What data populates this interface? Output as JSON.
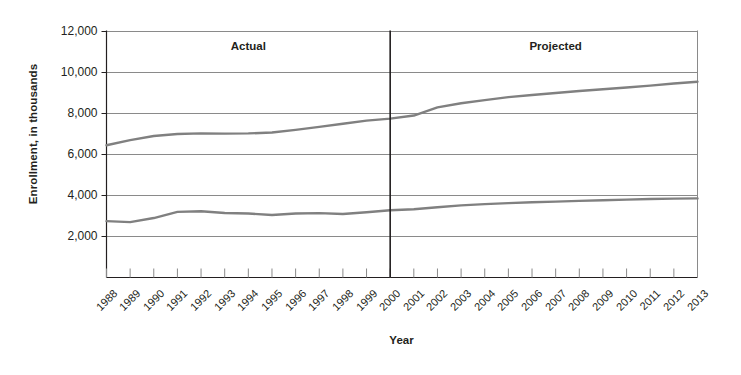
{
  "chart_data": {
    "type": "line",
    "title": "",
    "xlabel": "Year",
    "ylabel": "Enrollment, in thousands",
    "ylim": [
      0,
      12000
    ],
    "ytick_values": [
      2000,
      4000,
      6000,
      8000,
      10000,
      12000
    ],
    "ytick_labels": [
      "2,000",
      "4,000",
      "6,000",
      "8,000",
      "10,000",
      "12,000"
    ],
    "grid": "horizontal",
    "legend": "none",
    "categories": [
      "1988",
      "1989",
      "1990",
      "1991",
      "1992",
      "1993",
      "1994",
      "1995",
      "1996",
      "1997",
      "1998",
      "1999",
      "2000",
      "2001",
      "2002",
      "2003",
      "2004",
      "2005",
      "2006",
      "2007",
      "2008",
      "2009",
      "2010",
      "2011",
      "2012",
      "2013"
    ],
    "x": [
      1988,
      1989,
      1990,
      1991,
      1992,
      1993,
      1994,
      1995,
      1996,
      1997,
      1998,
      1999,
      2000,
      2001,
      2002,
      2003,
      2004,
      2005,
      2006,
      2007,
      2008,
      2009,
      2010,
      2011,
      2012,
      2013
    ],
    "series": [
      {
        "name": "upper-series",
        "color": "#808080",
        "values": [
          6450,
          6700,
          6900,
          7000,
          7030,
          7020,
          7030,
          7070,
          7200,
          7350,
          7500,
          7650,
          7750,
          7900,
          8300,
          8500,
          8650,
          8800,
          8900,
          9000,
          9100,
          9180,
          9270,
          9360,
          9460,
          9550
        ]
      },
      {
        "name": "lower-series",
        "color": "#808080",
        "values": [
          2750,
          2700,
          2900,
          3200,
          3230,
          3150,
          3120,
          3050,
          3120,
          3140,
          3100,
          3180,
          3280,
          3330,
          3430,
          3520,
          3580,
          3630,
          3670,
          3700,
          3740,
          3770,
          3800,
          3830,
          3850,
          3860
        ]
      }
    ],
    "annotations": [
      {
        "name": "actual-region",
        "text": "Actual",
        "at_x_fraction": 0.24,
        "at_y": 11200
      },
      {
        "name": "projected-region",
        "text": "Projected",
        "at_x_fraction": 0.76,
        "at_y": 11200
      }
    ],
    "divider": {
      "name": "actual-projected-divider",
      "at_x": 2000,
      "color": "#231f20"
    }
  },
  "colors": {
    "axis": "#231f20",
    "gridline": "#8a8a8a",
    "line": "#808080",
    "text": "#231f20",
    "background": "#ffffff"
  }
}
